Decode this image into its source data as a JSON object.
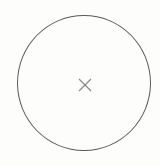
{
  "button": {
    "shape": "circle",
    "icon": "close-icon",
    "border_color": "#5a5a5a",
    "background_color": "#fdfdfb",
    "icon_color": "#8a8a8a"
  }
}
